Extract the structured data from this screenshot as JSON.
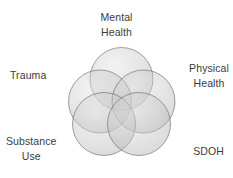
{
  "diagram": {
    "type": "venn-rosette",
    "title": "",
    "background_color": "#ffffff",
    "text_color": "#3b3b3b",
    "circle_fill_color": "#b4b4b4",
    "circle_stroke_color": "#7a7a7a",
    "circle_opacity": 0.42,
    "circle_count": 5,
    "labels": [
      {
        "id": "mental-health",
        "lines": [
          "Mental",
          "Health"
        ],
        "position": "top"
      },
      {
        "id": "physical-health",
        "lines": [
          "Physical",
          "Health"
        ],
        "position": "right"
      },
      {
        "id": "sdoh",
        "lines": [
          "SDOH"
        ],
        "position": "bottom-right"
      },
      {
        "id": "substance-use",
        "lines": [
          "Substance",
          "Use"
        ],
        "position": "bottom-left"
      },
      {
        "id": "trauma",
        "lines": [
          "Trauma"
        ],
        "position": "left"
      }
    ],
    "circles": [
      {
        "id": "circle-mental-health",
        "cx": 121.5,
        "cy": 79.0,
        "r": 31.5
      },
      {
        "id": "circle-physical-health",
        "cx": 143.5,
        "cy": 101.5,
        "r": 31.5
      },
      {
        "id": "circle-sdoh",
        "cx": 131.0,
        "cy": 124.0,
        "r": 31.5
      },
      {
        "id": "circle-substance-use",
        "cx": 102.0,
        "cy": 124.0,
        "r": 31.5
      },
      {
        "id": "circle-trauma",
        "cx": 100.0,
        "cy": 101.5,
        "r": 31.5
      }
    ]
  }
}
